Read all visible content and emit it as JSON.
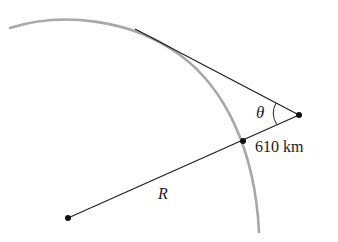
{
  "diagram": {
    "type": "geometry",
    "labels": {
      "angle": "θ",
      "altitude": "610 km",
      "radius": "R"
    },
    "colors": {
      "arc": "#a8a8a8",
      "lines": "#222222",
      "points": "#111111",
      "background": "#ffffff"
    },
    "points": {
      "center": [
        68,
        218
      ],
      "surface_point": [
        243,
        141
      ],
      "observer": [
        299,
        115
      ],
      "tangent_start": [
        135,
        29
      ]
    }
  }
}
